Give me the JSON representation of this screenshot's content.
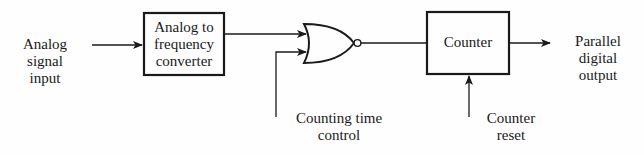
{
  "diagram": {
    "type": "block-diagram",
    "colors": {
      "line": "#1a1a1a",
      "background": "#fefefe"
    },
    "nodes": [
      {
        "id": "input",
        "kind": "terminal",
        "label_lines": [
          "Analog",
          "signal",
          "input"
        ]
      },
      {
        "id": "a2f",
        "kind": "block",
        "label_lines": [
          "Analog to",
          "frequency",
          "converter"
        ]
      },
      {
        "id": "gate",
        "kind": "nor-gate",
        "label_lines": []
      },
      {
        "id": "counter",
        "kind": "block",
        "label_lines": [
          "Counter"
        ]
      },
      {
        "id": "output",
        "kind": "terminal",
        "label_lines": [
          "Parallel",
          "digital",
          "output"
        ]
      },
      {
        "id": "ctc",
        "kind": "terminal",
        "label_lines": [
          "Counting time",
          "control"
        ]
      },
      {
        "id": "reset",
        "kind": "terminal",
        "label_lines": [
          "Counter",
          "reset"
        ]
      }
    ],
    "edges": [
      {
        "from": "input",
        "to": "a2f"
      },
      {
        "from": "a2f",
        "to": "gate"
      },
      {
        "from": "ctc",
        "to": "gate"
      },
      {
        "from": "gate",
        "to": "counter"
      },
      {
        "from": "reset",
        "to": "counter"
      },
      {
        "from": "counter",
        "to": "output"
      }
    ]
  },
  "labels": {
    "input": {
      "l1": "Analog",
      "l2": "signal",
      "l3": "input"
    },
    "a2f": {
      "l1": "Analog to",
      "l2": "frequency",
      "l3": "converter"
    },
    "counter": {
      "l1": "Counter"
    },
    "output": {
      "l1": "Parallel",
      "l2": "digital",
      "l3": "output"
    },
    "ctc": {
      "l1": "Counting time",
      "l2": "control"
    },
    "reset": {
      "l1": "Counter",
      "l2": "reset"
    }
  }
}
